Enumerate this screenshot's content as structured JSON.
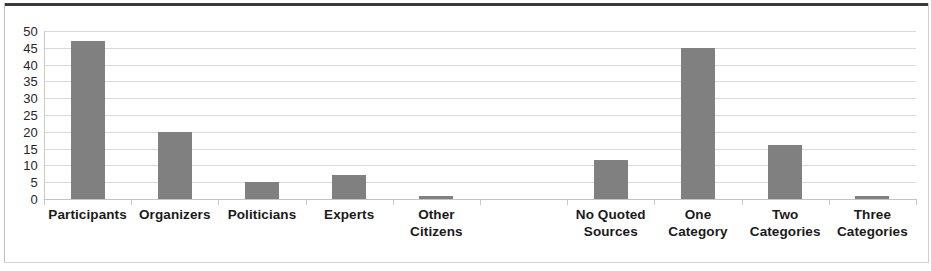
{
  "chart_data": {
    "type": "bar",
    "title": "",
    "subtitle": "",
    "xlabel": "",
    "ylabel": "",
    "ylim": [
      0,
      50
    ],
    "ytick_step": 5,
    "ytick_labels": [
      "50",
      "45",
      "40",
      "35",
      "30",
      "25",
      "20",
      "15",
      "10",
      "5",
      "0"
    ],
    "ytick_values": [
      50,
      45,
      40,
      35,
      30,
      25,
      20,
      15,
      10,
      5,
      0
    ],
    "grid": true,
    "grid_axis": "y",
    "legend": false,
    "legend_position": "none",
    "bar_color": "#808080",
    "grid_color": "#d9d9d9",
    "categories": [
      "Participants",
      "Organizers",
      "Politicians",
      "Experts",
      "Other Citizens",
      "",
      "No Quoted Sources",
      "One Category",
      "Two Categories",
      "Three Categories"
    ],
    "category_lines": [
      [
        "Participants",
        ""
      ],
      [
        "Organizers",
        ""
      ],
      [
        "Politicians",
        ""
      ],
      [
        "Experts",
        ""
      ],
      [
        "Other",
        "Citizens"
      ],
      [
        "",
        ""
      ],
      [
        "No Quoted",
        "Sources"
      ],
      [
        "One",
        "Category"
      ],
      [
        "Two",
        "Categories"
      ],
      [
        "Three",
        "Categories"
      ]
    ],
    "values": [
      47,
      20,
      5,
      7,
      1,
      null,
      11.5,
      45,
      16,
      1
    ]
  }
}
